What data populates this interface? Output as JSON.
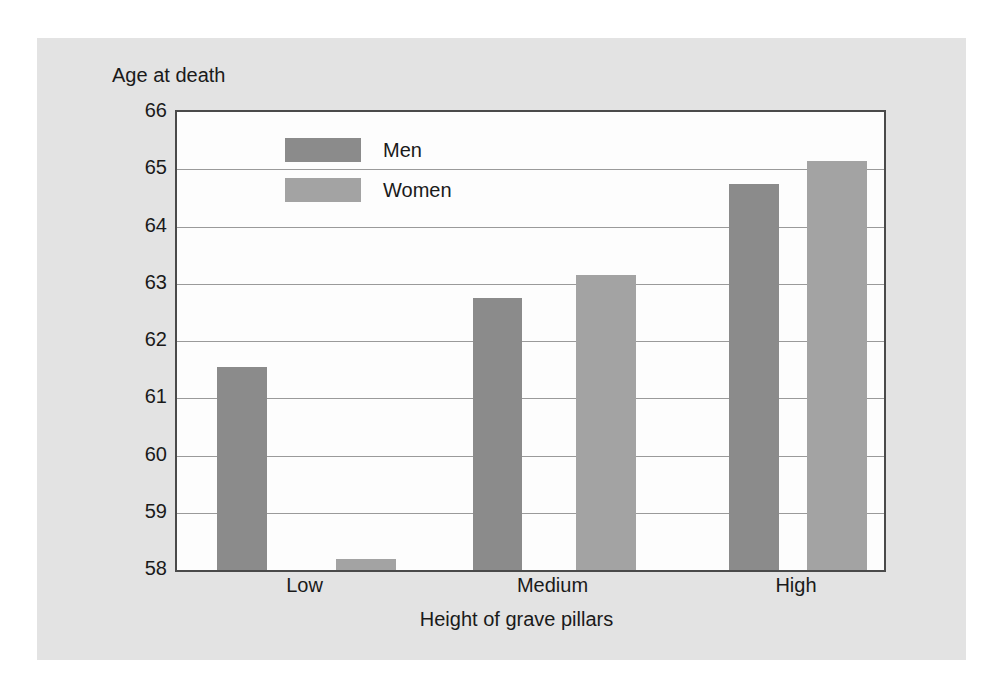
{
  "figure": {
    "background_color": "#e3e3e3",
    "plot_background_color": "#fdfdfd",
    "frame_color": "#4a4a4a"
  },
  "chart_data": {
    "type": "bar",
    "title": "",
    "subtitle": "",
    "xlabel": "Height of grave pillars",
    "ylabel": "Age at death",
    "categories": [
      "Low",
      "Medium",
      "High"
    ],
    "series": [
      {
        "name": "Men",
        "color": "#8b8b8b",
        "values": [
          61.55,
          62.75,
          64.75
        ]
      },
      {
        "name": "Women",
        "color": "#a3a3a3",
        "values": [
          58.2,
          63.15,
          65.15
        ]
      }
    ],
    "ylim": [
      58,
      66
    ],
    "ytick_labels": [
      "66",
      "65",
      "64",
      "63",
      "62",
      "61",
      "60",
      "59",
      "58"
    ],
    "ytick_values": [
      66,
      65,
      64,
      63,
      62,
      61,
      60,
      59,
      58
    ],
    "grid": true,
    "grid_axis": "y",
    "legend_position": "top-left-inside",
    "annotations": []
  },
  "legend": {
    "items": [
      {
        "label": "Men",
        "color": "#8b8b8b"
      },
      {
        "label": "Women",
        "color": "#a3a3a3"
      }
    ]
  }
}
